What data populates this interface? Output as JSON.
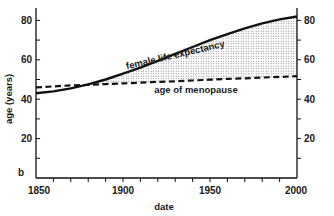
{
  "chart_data": {
    "type": "line",
    "title": "",
    "panel_label": "b",
    "xlabel": "date",
    "ylabel": "age (years)",
    "xlim": [
      1850,
      2000
    ],
    "ylim": [
      0,
      85
    ],
    "x_ticks": [
      1850,
      1900,
      1950,
      2000
    ],
    "y_ticks_left": [
      20,
      40,
      60,
      80
    ],
    "y_ticks_right": [
      20,
      40,
      60,
      80
    ],
    "grid": false,
    "legend": "inline annotations",
    "x": [
      1850,
      1860,
      1870,
      1880,
      1890,
      1900,
      1910,
      1920,
      1930,
      1940,
      1950,
      1960,
      1970,
      1980,
      1990,
      2000
    ],
    "series": [
      {
        "name": "female life expectancy",
        "style": "solid",
        "values": [
          43,
          44,
          45.5,
          47.5,
          50,
          53,
          56,
          59.5,
          63,
          66.5,
          70,
          73,
          76,
          78.5,
          80.5,
          82
        ]
      },
      {
        "name": "age of menopause",
        "style": "dashed",
        "values": [
          46,
          46.5,
          47,
          47.3,
          47.7,
          48,
          48.4,
          48.8,
          49.1,
          49.5,
          49.9,
          50.3,
          50.6,
          51,
          51.3,
          51.7
        ]
      }
    ],
    "shaded_region": "between female life expectancy and age of menopause, where life expectancy exceeds menopause age",
    "annotations": [
      {
        "text": "female life expectancy",
        "x": 1925,
        "y": 66
      },
      {
        "text": "age of menopause",
        "x": 1935,
        "y": 43
      }
    ]
  },
  "colors": {
    "line": "#111111",
    "shade": "#888888",
    "background": "#ffffff"
  }
}
